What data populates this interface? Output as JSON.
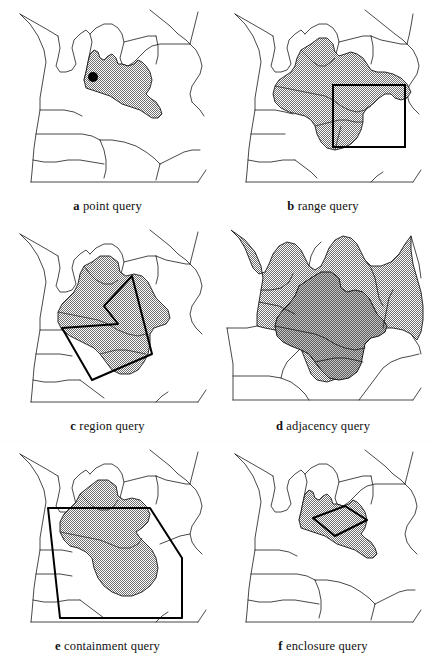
{
  "figure": {
    "background_color": "#ffffff",
    "line_color": "#1a1a1a",
    "shade_fill_color": "#9a9a9a",
    "shade_dark_color": "#8a8a8a",
    "point_color": "#000000",
    "columns": 2,
    "rows": 3
  },
  "panels": [
    {
      "id": "a",
      "label": "a",
      "caption": "point query",
      "full_caption": "a point query",
      "overlay": "point-marker",
      "overlay_label": "query-point",
      "point": {
        "x": 93,
        "y": 89,
        "radius": 5
      },
      "shaded_regions": 1
    },
    {
      "id": "b",
      "label": "b",
      "caption": "range query",
      "full_caption": "b range query",
      "overlay": "rectangle",
      "overlay_label": "query-rectangle",
      "rect": {
        "x": 332,
        "y": 99,
        "width": 55,
        "height": 48
      },
      "shaded_regions": 6
    },
    {
      "id": "c",
      "label": "c",
      "caption": "region query",
      "full_caption": "c region query",
      "overlay": "polygon",
      "overlay_label": "query-polygon",
      "shaded_regions": 4
    },
    {
      "id": "d",
      "label": "d",
      "caption": "adjacency query",
      "full_caption": "d adjacency query",
      "overlay": "none",
      "overlay_label": "no-overlay",
      "shaded_regions": 9
    },
    {
      "id": "e",
      "label": "e",
      "caption": "containment query",
      "full_caption": "e containment query",
      "overlay": "quadrilateral",
      "overlay_label": "query-quadrilateral",
      "shaded_regions": 2
    },
    {
      "id": "f",
      "label": "f",
      "caption": "enclosure query",
      "full_caption": "f enclosure query",
      "overlay": "small-quadrilateral",
      "overlay_label": "query-small-quadrilateral",
      "shaded_regions": 1
    }
  ]
}
